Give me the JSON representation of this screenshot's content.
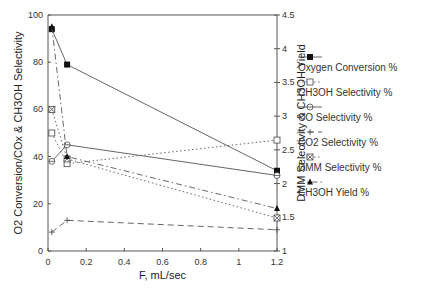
{
  "chart_data": {
    "type": "line",
    "title": "",
    "xlabel": "F, mL/sec",
    "ylabel": "O2 Conversion/COx & CH3OH Selectivity",
    "y2label": "DMM Selectivity & CH3OH Yield",
    "xlim": [
      0,
      1.2
    ],
    "ylim": [
      0,
      100
    ],
    "y2lim": [
      1,
      4.5
    ],
    "x_ticks": [
      "0",
      "0.2",
      "0.4",
      "0.6",
      "0.8",
      "1",
      "1.2"
    ],
    "y_ticks": [
      "0",
      "20",
      "40",
      "60",
      "80",
      "100"
    ],
    "y2_ticks": [
      "1",
      "1.5",
      "2",
      "2.5",
      "3",
      "3.5",
      "4",
      "4.5"
    ],
    "grid": false,
    "legend_position": "right",
    "x": [
      0.02,
      0.1,
      1.2
    ],
    "series": [
      {
        "name": "Oxygen Conversion %",
        "values": [
          94,
          79,
          34
        ],
        "marker": "filled-square",
        "line": "solid"
      },
      {
        "name": "CH3OH Selectivity %",
        "values": [
          50,
          37,
          47
        ],
        "marker": "open-square",
        "line": "dotted"
      },
      {
        "name": "CO Selectivity %",
        "values": [
          38,
          45,
          32
        ],
        "marker": "circle-cross",
        "line": "solid"
      },
      {
        "name": "CO2 Selectivity %",
        "values": [
          8,
          13,
          9
        ],
        "marker": "plus",
        "line": "dashed"
      },
      {
        "name": "DMM Selectivity %",
        "values": [
          60,
          39,
          14
        ],
        "marker": "x-box",
        "line": "dotted"
      },
      {
        "name": "CH3OH Yield %",
        "values": [
          95,
          40,
          18
        ],
        "marker": "triangle",
        "line": "dash-dot"
      }
    ]
  }
}
